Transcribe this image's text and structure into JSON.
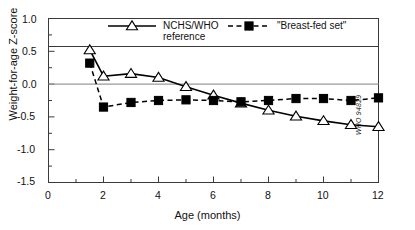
{
  "chart_data": {
    "type": "line",
    "title": "",
    "xlabel": "Age (months)",
    "ylabel": "Weight-for-age Z-score",
    "xlim": [
      0,
      12
    ],
    "ylim": [
      -1.5,
      1.0
    ],
    "xticks": [
      "0",
      "2",
      "4",
      "6",
      "8",
      "10",
      "12"
    ],
    "xtick_values": [
      0,
      2,
      4,
      6,
      8,
      10,
      12
    ],
    "xminor_values": [
      1,
      3,
      5,
      7,
      9,
      11
    ],
    "yticks": [
      "1.0",
      "0.5",
      "0.0",
      "-0.5",
      "-1.0",
      "-1.5"
    ],
    "ytick_values": [
      1.0,
      0.5,
      0.0,
      -0.5,
      -1.0,
      -1.5
    ],
    "yminor_values": [
      0.75,
      0.25,
      -0.25,
      -0.75,
      -1.25
    ],
    "grid": false,
    "zero_line": true,
    "legend_position": "top-inside",
    "series": [
      {
        "name": "NCHS/WHO reference",
        "marker": "open-triangle",
        "line": "solid",
        "color": "#000000",
        "x": [
          1.5,
          2,
          3,
          4,
          5,
          6,
          7,
          8,
          9,
          10,
          11,
          12
        ],
        "y": [
          0.52,
          0.12,
          0.16,
          0.1,
          -0.04,
          -0.17,
          -0.29,
          -0.4,
          -0.49,
          -0.56,
          -0.62,
          -0.65
        ]
      },
      {
        "name": "\"Breast-fed set\"",
        "marker": "filled-square",
        "line": "dashed",
        "color": "#000000",
        "x": [
          1.5,
          2,
          3,
          4,
          5,
          6,
          7,
          8,
          9,
          10,
          11,
          12
        ],
        "y": [
          0.32,
          -0.35,
          -0.28,
          -0.25,
          -0.24,
          -0.25,
          -0.27,
          -0.25,
          -0.22,
          -0.22,
          -0.25,
          -0.21
        ]
      }
    ],
    "annotations": [
      {
        "name": "who-catalog-code",
        "text": "WHO 94829",
        "position": "bottom-right-outside-vertical"
      }
    ]
  },
  "legend": {
    "items": [
      {
        "label_line1": "NCHS/WHO",
        "label_line2": "reference",
        "marker": "open-triangle",
        "line": "solid"
      },
      {
        "label_line1": "\"Breast-fed set\"",
        "label_line2": "",
        "marker": "filled-square",
        "line": "dashed"
      }
    ]
  },
  "colors": {
    "ink": "#000000",
    "axis": "#2b2b2b",
    "zero_line": "#9a9a9a",
    "background": "#ffffff"
  }
}
